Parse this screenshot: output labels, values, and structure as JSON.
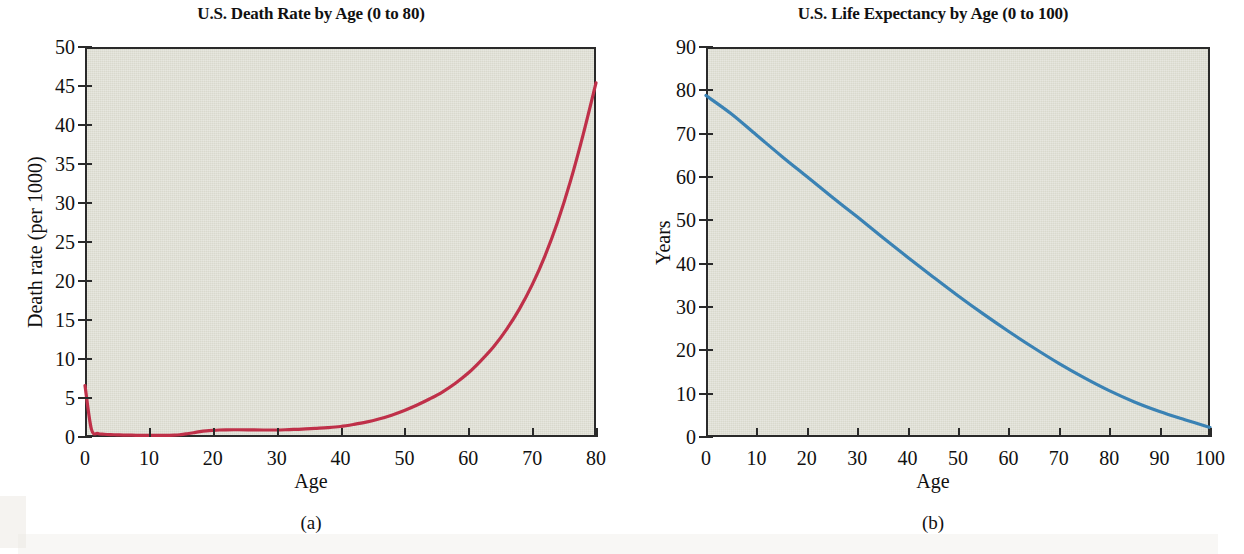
{
  "figure": {
    "caption_a": "(a)",
    "caption_b": "(b)",
    "background_color": "#ffffff",
    "plot_background_color": "#d9d9cd",
    "axis_color": "#2a2a2a"
  },
  "chart_data": [
    {
      "type": "line",
      "id": "death-rate",
      "title": "U.S. Death Rate by Age (0 to 80)",
      "xlabel": "Age",
      "ylabel": "Death rate (per 1000)",
      "caption": "(a)",
      "line_color": "#bf2f४a",
      "series_color": "#bf3049",
      "xlim": [
        0,
        80
      ],
      "ylim": [
        0,
        50
      ],
      "xticks": [
        0,
        10,
        20,
        30,
        40,
        50,
        60,
        70,
        80
      ],
      "yticks": [
        0,
        5,
        10,
        15,
        20,
        25,
        30,
        35,
        40,
        45,
        50
      ],
      "grid": false,
      "legend": "none",
      "x": [
        0,
        1,
        2,
        3,
        4,
        5,
        6,
        8,
        10,
        12,
        14,
        15,
        16,
        17,
        18,
        19,
        20,
        21,
        22,
        24,
        26,
        28,
        30,
        32,
        34,
        36,
        38,
        40,
        42,
        44,
        46,
        48,
        50,
        52,
        54,
        56,
        58,
        60,
        62,
        64,
        66,
        68,
        70,
        72,
        74,
        76,
        78,
        80
      ],
      "y": [
        6.6,
        1.0,
        0.45,
        0.35,
        0.3,
        0.28,
        0.25,
        0.22,
        0.2,
        0.2,
        0.23,
        0.3,
        0.42,
        0.55,
        0.68,
        0.78,
        0.85,
        0.9,
        0.92,
        0.93,
        0.92,
        0.9,
        0.9,
        0.95,
        1.0,
        1.1,
        1.2,
        1.35,
        1.6,
        1.9,
        2.3,
        2.8,
        3.4,
        4.1,
        4.9,
        5.8,
        6.9,
        8.2,
        9.8,
        11.6,
        13.8,
        16.4,
        19.5,
        23.2,
        27.6,
        32.8,
        38.8,
        45.4
      ]
    },
    {
      "type": "line",
      "id": "life-expectancy",
      "title": "U.S. Life Expectancy by Age (0 to 100)",
      "xlabel": "Age",
      "ylabel": "Years",
      "caption": "(b)",
      "series_color": "#3a82b4",
      "xlim": [
        0,
        100
      ],
      "ylim": [
        0,
        90
      ],
      "xticks": [
        0,
        10,
        20,
        30,
        40,
        50,
        60,
        70,
        80,
        90,
        100
      ],
      "yticks": [
        0,
        10,
        20,
        30,
        40,
        50,
        60,
        70,
        80,
        90
      ],
      "grid": false,
      "legend": "none",
      "x": [
        0,
        5,
        10,
        15,
        20,
        25,
        30,
        35,
        40,
        45,
        50,
        55,
        60,
        65,
        70,
        75,
        80,
        85,
        90,
        95,
        100
      ],
      "y": [
        78.8,
        74.6,
        69.7,
        64.8,
        60.1,
        55.4,
        50.8,
        46.1,
        41.5,
        37.0,
        32.6,
        28.4,
        24.4,
        20.6,
        17.0,
        13.7,
        10.7,
        8.1,
        5.9,
        4.0,
        2.2
      ]
    }
  ]
}
